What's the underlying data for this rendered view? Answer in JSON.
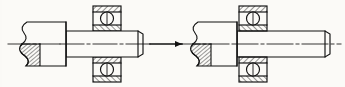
{
  "drawing": {
    "title": "Shaft and ball bearing assembly sequence",
    "type": "mechanical-section-drawing",
    "background_color": "#fbfaf7",
    "line_color": "#111111",
    "hatch_color": "#111111",
    "states": [
      {
        "name": "before-assembly",
        "label": "",
        "components": [
          "shaft",
          "ball-bearing"
        ],
        "note": "shaft positioned to the left of the bearing, not yet inserted"
      },
      {
        "name": "after-assembly",
        "label": "",
        "components": [
          "shaft",
          "ball-bearing"
        ],
        "note": "shaft inserted through the bearing bore"
      }
    ],
    "motion_arrow": {
      "name": "assembly-direction-arrow",
      "direction": "right",
      "x1": 148,
      "x2": 184,
      "y": 44
    },
    "left_assembly": {
      "hub": {
        "x": 21,
        "y": 22,
        "width": 45,
        "height": 44,
        "label": "shaft hub"
      },
      "break_line": {
        "name": "broken-section-break",
        "x": 21,
        "y_top": 22,
        "y_bottom": 66
      },
      "hatch_region": {
        "x": 21,
        "y": 44,
        "width": 16,
        "height": 22
      },
      "shaft": {
        "x": 66,
        "y": 31,
        "width": 77,
        "height": 26,
        "label": "shaft body"
      },
      "chamfer": {
        "x": 138,
        "width": 5
      },
      "centerline": {
        "x1": 8,
        "x2": 152,
        "y": 44
      }
    },
    "left_bearing": {
      "name": "ball-bearing-left",
      "x": 93,
      "y": 6,
      "width": 28,
      "height": 76,
      "outer_race_thickness": 6,
      "inner_race_thickness": 6,
      "ball_diameter": 13,
      "ball_centers_y": [
        18,
        70
      ]
    },
    "right_assembly": {
      "hub": {
        "x": 192,
        "y": 22,
        "width": 45,
        "height": 44,
        "label": "shaft hub"
      },
      "break_line": {
        "name": "broken-section-break",
        "x": 192,
        "y_top": 22,
        "y_bottom": 66
      },
      "hatch_region": {
        "x": 192,
        "y": 44,
        "width": 16,
        "height": 22
      },
      "shaft": {
        "x": 237,
        "y": 31,
        "width": 93,
        "height": 26,
        "label": "shaft body"
      },
      "chamfer": {
        "x": 325,
        "width": 5
      },
      "centerline": {
        "x1": 178,
        "x2": 341,
        "y": 44
      }
    },
    "right_bearing": {
      "name": "ball-bearing-right",
      "x": 239,
      "y": 6,
      "width": 28,
      "height": 76,
      "outer_race_thickness": 6,
      "inner_race_thickness": 6,
      "ball_diameter": 13,
      "ball_centers_y": [
        18,
        70
      ]
    }
  }
}
